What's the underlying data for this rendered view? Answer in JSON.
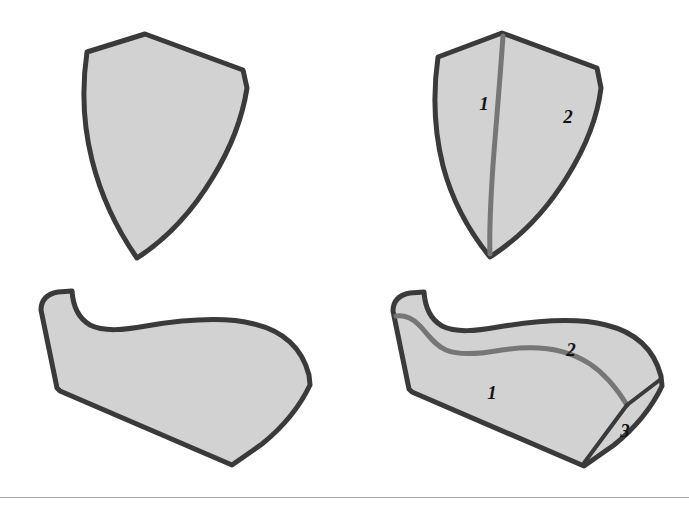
{
  "figure": {
    "background_color": "#ffffff",
    "outline_color": "#3a3a3a",
    "inner_line_color": "#767676",
    "fill_color": "#d2d2d2",
    "fill_color_shaded": "#c8c8c8",
    "label_color": "#141414",
    "footer_rule_color": "#a8a8ae"
  },
  "panels": {
    "top_left": {
      "name": "unlabeled-wedge-shape",
      "regions": []
    },
    "top_right": {
      "name": "segmented-wedge-shape",
      "regions": [
        {
          "label": "1",
          "x": 484,
          "y": 103
        },
        {
          "label": "2",
          "x": 568,
          "y": 116
        }
      ]
    },
    "bottom_left": {
      "name": "unlabeled-block-shape",
      "regions": []
    },
    "bottom_right": {
      "name": "segmented-block-shape",
      "regions": [
        {
          "label": "1",
          "x": 492,
          "y": 392
        },
        {
          "label": "2",
          "x": 571,
          "y": 349
        },
        {
          "label": "3",
          "x": 625,
          "y": 430
        }
      ]
    }
  },
  "footer": {
    "rule_top": 497
  }
}
